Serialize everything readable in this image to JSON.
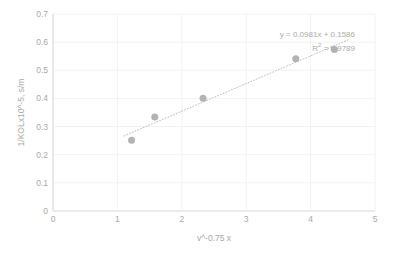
{
  "chart_data": {
    "type": "scatter",
    "title": "",
    "subtitle": "",
    "xlabel": "v^-0.75 x",
    "ylabel": "1/KOLx10^-5, s/m",
    "xlim": [
      0,
      5
    ],
    "ylim": [
      0,
      0.7
    ],
    "x_ticks": [
      "0",
      "1",
      "2",
      "3",
      "4",
      "5"
    ],
    "x_tick_values": [
      0,
      1,
      2,
      3,
      4,
      5
    ],
    "y_ticks": [
      "0",
      "0.1",
      "0.2",
      "0.3",
      "0.4",
      "0.5",
      "0.6",
      "0.7"
    ],
    "y_tick_values": [
      0,
      0.1,
      0.2,
      0.3,
      0.4,
      0.5,
      0.6,
      0.7
    ],
    "grid": {
      "horizontal": true,
      "vertical": true,
      "color": "#f2f2f2"
    },
    "legend": {
      "visible": false,
      "position": "none",
      "entries": []
    },
    "series": [
      {
        "name": "1/KOL vs v^-0.75",
        "marker": "circle",
        "marker_color": "#b3b3b3",
        "marker_size": 7,
        "x": [
          1.22,
          1.58,
          2.33,
          3.77,
          4.37
        ],
        "y": [
          0.251,
          0.334,
          0.401,
          0.541,
          0.574
        ],
        "points": [
          {
            "x": 1.22,
            "y": 0.251
          },
          {
            "x": 1.58,
            "y": 0.334
          },
          {
            "x": 2.33,
            "y": 0.401
          },
          {
            "x": 3.77,
            "y": 0.541
          },
          {
            "x": 4.37,
            "y": 0.574
          }
        ]
      }
    ],
    "trendline": {
      "type": "linear",
      "style": "dotted",
      "color": "#bfbfbf",
      "slope": 0.0981,
      "intercept": 0.1586,
      "r_squared": 0.9789,
      "x_start": 1.1,
      "x_end": 4.6,
      "equation_label": "y = 0.0981x + 0.1586",
      "r2_label_prefix": "R",
      "r2_label_sup": "2",
      "r2_label_suffix": " = 0.9789"
    }
  },
  "annotations": {
    "equation": "y = 0.0981x + 0.1586",
    "r_squared_prefix": "R",
    "r_squared_exponent": "2",
    "r_squared_value": " = 0.9789"
  },
  "axes": {
    "x_title": "v^-0.75 x",
    "y_title": "1/KOLx10^-5, s/m"
  },
  "colors": {
    "background": "#ffffff",
    "grid": "#f2f2f2",
    "axis": "#d9d9d9",
    "text": "#a9a9a9",
    "marker": "#b3b3b3",
    "trendline": "#bfbfbf"
  }
}
